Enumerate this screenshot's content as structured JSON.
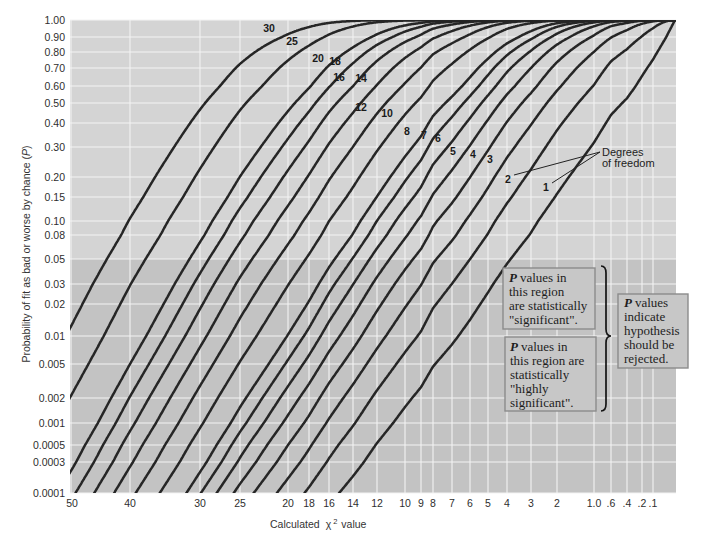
{
  "chart_data": {
    "type": "line",
    "title": "",
    "xlabel": "Calculated χ² value",
    "xlabel_parts": {
      "prefix": "Calculated",
      "symbol": "χ",
      "superscript": "2",
      "suffix": "value"
    },
    "ylabel": "Probability of fit as bad or worse by chance (P)",
    "ylabel_parts": {
      "prefix": "Probability of fit as bad or worse by chance (",
      "variable": "P",
      "suffix": ")"
    },
    "xlim": [
      50,
      0
    ],
    "x_reversed": true,
    "ylim": [
      0.0001,
      1.0
    ],
    "grid": true,
    "legend": "none - curves labeled inline with degrees of freedom",
    "curve_function": "upper-tail chi-square probability P(chi2 >= x | degrees of freedom)",
    "x_ticks": [
      {
        "label": "50",
        "value": 50
      },
      {
        "label": "40",
        "value": 40
      },
      {
        "label": "30",
        "value": 30
      },
      {
        "label": "25",
        "value": 25
      },
      {
        "label": "20",
        "value": 20
      },
      {
        "label": "18",
        "value": 18
      },
      {
        "label": "16",
        "value": 16
      },
      {
        "label": "14",
        "value": 14
      },
      {
        "label": "12",
        "value": 12
      },
      {
        "label": "10",
        "value": 10
      },
      {
        "label": "9",
        "value": 9
      },
      {
        "label": "8",
        "value": 8
      },
      {
        "label": "7",
        "value": 7
      },
      {
        "label": "6",
        "value": 6
      },
      {
        "label": "5",
        "value": 5
      },
      {
        "label": "4",
        "value": 4
      },
      {
        "label": "3",
        "value": 3
      },
      {
        "label": "2",
        "value": 2
      },
      {
        "label": "1.0",
        "value": 1.0
      },
      {
        "label": ".6",
        "value": 0.6
      },
      {
        "label": ".4",
        "value": 0.4
      },
      {
        "label": ".2",
        "value": 0.2
      },
      {
        "label": ".1",
        "value": 0.1
      }
    ],
    "y_ticks": [
      {
        "label": "1.00",
        "value": 1.0
      },
      {
        "label": "0.90",
        "value": 0.9
      },
      {
        "label": "0.80",
        "value": 0.8
      },
      {
        "label": "0.70",
        "value": 0.7
      },
      {
        "label": "0.60",
        "value": 0.6
      },
      {
        "label": "0.50",
        "value": 0.5
      },
      {
        "label": "0.40",
        "value": 0.4
      },
      {
        "label": "0.30",
        "value": 0.3
      },
      {
        "label": "0.20",
        "value": 0.2
      },
      {
        "label": "0.15",
        "value": 0.15
      },
      {
        "label": "0.10",
        "value": 0.1
      },
      {
        "label": "0.08",
        "value": 0.08
      },
      {
        "label": "0.05",
        "value": 0.05
      },
      {
        "label": "0.03",
        "value": 0.03
      },
      {
        "label": "0.02",
        "value": 0.02
      },
      {
        "label": "0.01",
        "value": 0.01
      },
      {
        "label": "0.005",
        "value": 0.005
      },
      {
        "label": "0.002",
        "value": 0.002
      },
      {
        "label": "0.001",
        "value": 0.001
      },
      {
        "label": "0.0005",
        "value": 0.0005
      },
      {
        "label": "0.0003",
        "value": 0.0003
      },
      {
        "label": "0.0001",
        "value": 0.0001
      }
    ],
    "series": [
      {
        "name": "1",
        "df": 1,
        "points": [
          [
            0.455,
            0.5
          ],
          [
            3.84,
            0.05
          ],
          [
            6.63,
            0.01
          ],
          [
            10.83,
            0.001
          ]
        ]
      },
      {
        "name": "2",
        "df": 2,
        "points": [
          [
            1.386,
            0.5
          ],
          [
            5.99,
            0.05
          ],
          [
            9.21,
            0.01
          ],
          [
            13.82,
            0.001
          ]
        ]
      },
      {
        "name": "3",
        "df": 3,
        "points": [
          [
            2.366,
            0.5
          ],
          [
            7.81,
            0.05
          ],
          [
            11.34,
            0.01
          ],
          [
            16.27,
            0.001
          ]
        ]
      },
      {
        "name": "4",
        "df": 4,
        "points": [
          [
            3.357,
            0.5
          ],
          [
            9.49,
            0.05
          ],
          [
            13.28,
            0.01
          ],
          [
            18.47,
            0.001
          ]
        ]
      },
      {
        "name": "5",
        "df": 5,
        "points": [
          [
            4.351,
            0.5
          ],
          [
            11.07,
            0.05
          ],
          [
            15.09,
            0.01
          ],
          [
            20.52,
            0.001
          ]
        ]
      },
      {
        "name": "6",
        "df": 6,
        "points": [
          [
            5.348,
            0.5
          ],
          [
            12.59,
            0.05
          ],
          [
            16.81,
            0.01
          ],
          [
            22.46,
            0.001
          ]
        ]
      },
      {
        "name": "7",
        "df": 7,
        "points": [
          [
            6.346,
            0.5
          ],
          [
            14.07,
            0.05
          ],
          [
            18.48,
            0.01
          ],
          [
            24.32,
            0.001
          ]
        ]
      },
      {
        "name": "8",
        "df": 8,
        "points": [
          [
            7.344,
            0.5
          ],
          [
            15.51,
            0.05
          ],
          [
            20.09,
            0.01
          ],
          [
            26.12,
            0.001
          ]
        ]
      },
      {
        "name": "10",
        "df": 10,
        "points": [
          [
            9.342,
            0.5
          ],
          [
            18.31,
            0.05
          ],
          [
            23.21,
            0.01
          ],
          [
            29.59,
            0.001
          ]
        ]
      },
      {
        "name": "12",
        "df": 12,
        "points": [
          [
            11.34,
            0.5
          ],
          [
            21.03,
            0.05
          ],
          [
            26.22,
            0.01
          ],
          [
            32.91,
            0.001
          ]
        ]
      },
      {
        "name": "14",
        "df": 14,
        "points": [
          [
            13.34,
            0.5
          ],
          [
            23.68,
            0.05
          ],
          [
            29.14,
            0.01
          ],
          [
            36.12,
            0.001
          ]
        ]
      },
      {
        "name": "16",
        "df": 16,
        "points": [
          [
            15.34,
            0.5
          ],
          [
            26.3,
            0.05
          ],
          [
            32.0,
            0.01
          ],
          [
            39.25,
            0.001
          ]
        ]
      },
      {
        "name": "18",
        "df": 18,
        "points": [
          [
            17.34,
            0.5
          ],
          [
            28.87,
            0.05
          ],
          [
            34.81,
            0.01
          ],
          [
            42.31,
            0.001
          ]
        ]
      },
      {
        "name": "20",
        "df": 20,
        "points": [
          [
            19.34,
            0.5
          ],
          [
            31.41,
            0.05
          ],
          [
            37.57,
            0.01
          ],
          [
            45.31,
            0.001
          ]
        ]
      },
      {
        "name": "25",
        "df": 25,
        "points": [
          [
            24.34,
            0.5
          ],
          [
            37.65,
            0.05
          ],
          [
            44.31,
            0.01
          ],
          [
            52.62,
            0.001
          ]
        ]
      },
      {
        "name": "30",
        "df": 30,
        "points": [
          [
            29.34,
            0.5
          ],
          [
            43.77,
            0.05
          ],
          [
            50.89,
            0.01
          ],
          [
            59.7,
            0.001
          ]
        ]
      }
    ],
    "shaded_region": {
      "description": "darker background where P is below 0.05",
      "p_max": 0.05
    },
    "callout": {
      "lines": [
        "Degrees",
        "of freedom"
      ],
      "points_to_series": [
        "2",
        "1"
      ]
    },
    "annotations": [
      {
        "id": "significant",
        "lead": "P",
        "lines": [
          "values in",
          "this region",
          "are statistically",
          "\"significant\"."
        ]
      },
      {
        "id": "highly-significant",
        "lead": "P",
        "lines": [
          "values in",
          "this region are",
          "statistically",
          "\"highly",
          "significant\"."
        ]
      },
      {
        "id": "reject",
        "lead": "P",
        "lines": [
          "values",
          "indicate",
          "hypothesis",
          "should be",
          "rejected."
        ]
      }
    ],
    "layout": {
      "plot": {
        "left": 70,
        "top": 20,
        "right": 676,
        "bottom": 493
      },
      "x_tick_px": [
        71,
        130,
        200,
        240,
        288,
        309,
        329,
        353,
        377,
        405,
        421,
        433,
        452,
        470,
        488,
        507,
        531,
        557,
        594,
        611,
        627,
        642,
        653
      ],
      "x_zero_px": 675,
      "y_tick_px": [
        20,
        37,
        52,
        68,
        86,
        103,
        123,
        147,
        177,
        197,
        221,
        235,
        259,
        284,
        304,
        336,
        364,
        398,
        423,
        445,
        462,
        493
      ],
      "label_pos": {
        "30": [
          269,
          32
        ],
        "25": [
          292,
          45
        ],
        "20": [
          318,
          62
        ],
        "18": [
          335,
          65
        ],
        "16": [
          339,
          81
        ],
        "14": [
          361,
          82
        ],
        "12": [
          361,
          111
        ],
        "10": [
          387,
          117
        ],
        "8": [
          407,
          135
        ],
        "7": [
          424,
          139
        ],
        "6": [
          438,
          142
        ],
        "5": [
          453,
          155
        ],
        "4": [
          473,
          158
        ],
        "3": [
          490,
          163
        ],
        "2": [
          508,
          183
        ],
        "1": [
          546,
          191
        ]
      }
    }
  }
}
